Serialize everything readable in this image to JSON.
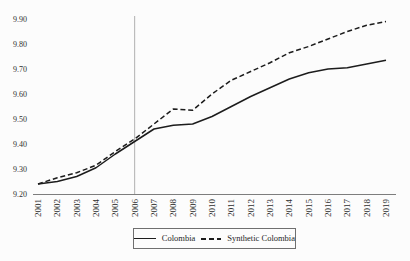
{
  "figure": {
    "background": "#fcfcfc",
    "line_color": "#1c1c1c",
    "axis_color": "#7d7d7d",
    "reference_line_color": "#b0b0b0",
    "text_color": "#2f2f2f"
  },
  "chart_data": {
    "type": "line",
    "title": "",
    "xlabel": "",
    "ylabel": "",
    "x": [
      2001,
      2002,
      2003,
      2004,
      2005,
      2006,
      2007,
      2008,
      2009,
      2010,
      2011,
      2012,
      2013,
      2014,
      2015,
      2016,
      2017,
      2018,
      2019
    ],
    "series": [
      {
        "name": "Colombia",
        "style": "solid",
        "values": [
          9.24,
          9.25,
          9.27,
          9.305,
          9.36,
          9.41,
          9.46,
          9.475,
          9.48,
          9.51,
          9.55,
          9.59,
          9.625,
          9.66,
          9.685,
          9.7,
          9.705,
          9.72,
          9.735
        ]
      },
      {
        "name": "Synthetic Colombia",
        "style": "dashed",
        "values": [
          9.24,
          9.265,
          9.285,
          9.315,
          9.37,
          9.42,
          9.48,
          9.54,
          9.535,
          9.6,
          9.655,
          9.69,
          9.725,
          9.765,
          9.79,
          9.82,
          9.85,
          9.875,
          9.89
        ]
      }
    ],
    "yticks": [
      9.2,
      9.3,
      9.4,
      9.5,
      9.6,
      9.7,
      9.8,
      9.9
    ],
    "ylim": [
      9.2,
      9.9
    ],
    "reference_line_x": 2006,
    "grid": false,
    "legend_position": "bottom-center"
  }
}
